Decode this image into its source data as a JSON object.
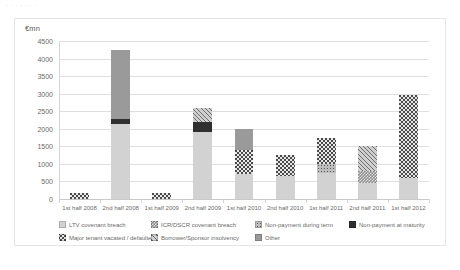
{
  "top_strip": {
    "text": "· · · · · · ·"
  },
  "chart_data": {
    "type": "bar",
    "stacked": true,
    "title": "",
    "subtitle": "",
    "xlabel": "",
    "ylabel": "€mn",
    "ylim": [
      0,
      4500
    ],
    "ytick_step": 500,
    "yticks": [
      "4500",
      "4000",
      "3500",
      "3000",
      "2500",
      "2000",
      "1500",
      "1000",
      "500",
      "0"
    ],
    "grid": true,
    "legend_position": "bottom",
    "categories": [
      "1st half 2008",
      "2nd half 2008",
      "1st half 2009",
      "2nd half 2009",
      "1st half 2010",
      "2nd half 2010",
      "1st half 2011",
      "2nd half 2011",
      "1st half 2012"
    ],
    "series": [
      {
        "name": "LTV covenant breach",
        "key": "ltv",
        "fill": "f-solid-light",
        "values": [
          0,
          2150,
          0,
          1900,
          700,
          650,
          750,
          450,
          600
        ]
      },
      {
        "name": "ICR/DSCR covenant breach",
        "key": "icr",
        "fill": "f-checker-mid",
        "values": [
          0,
          0,
          0,
          0,
          0,
          0,
          0,
          350,
          0
        ]
      },
      {
        "name": "Non-payment during term",
        "key": "nonpay_term",
        "fill": "f-dots",
        "values": [
          0,
          0,
          0,
          0,
          0,
          0,
          250,
          0,
          0
        ]
      },
      {
        "name": "Non-payment at maturity",
        "key": "nonpay_mat",
        "fill": "f-solid-dark",
        "values": [
          0,
          120,
          0,
          300,
          0,
          0,
          0,
          0,
          0
        ]
      },
      {
        "name": "Major tenant vacated / defaulted",
        "key": "tenant",
        "fill": "f-checker-dark",
        "values": [
          180,
          0,
          170,
          0,
          700,
          600,
          750,
          0,
          2350
        ]
      },
      {
        "name": "Borrower/Sponsor insolvency",
        "key": "insolvency",
        "fill": "f-hatch",
        "values": [
          0,
          0,
          0,
          400,
          0,
          0,
          0,
          700,
          0
        ]
      },
      {
        "name": "Other",
        "key": "other",
        "fill": "f-solid-mid",
        "values": [
          0,
          1980,
          0,
          0,
          600,
          0,
          0,
          0,
          0
        ]
      }
    ],
    "totals": [
      180,
      4250,
      170,
      2600,
      2000,
      1250,
      1750,
      1500,
      2950
    ]
  }
}
